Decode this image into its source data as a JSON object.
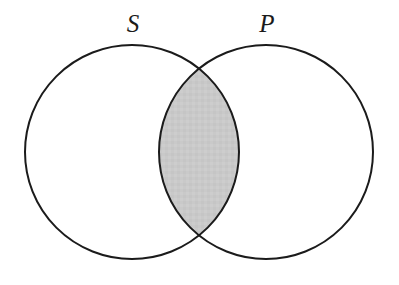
{
  "figure": {
    "name": "venn-diagram",
    "background_color": "#ffffff",
    "width": 399,
    "height": 285
  },
  "diagram": {
    "type": "venn",
    "circle_count": 2,
    "stroke_color": "#1b1b1b",
    "stroke_width": 2,
    "circles": [
      {
        "id": "subject-circle",
        "label": "S",
        "fill_color": "#ffffff",
        "center_x": 132,
        "center_y": 152,
        "radius": 107
      },
      {
        "id": "predicate-circle",
        "label": "P",
        "fill_color": "#ffffff",
        "center_x": 266,
        "center_y": 152,
        "radius": 107
      }
    ],
    "intersection": {
      "id": "intersection-region",
      "label": "",
      "shaded": true,
      "fill_color": "#c9c9c9",
      "left_x": 159,
      "right_x": 239,
      "top_y": 67,
      "bottom_y": 237
    },
    "labels": [
      {
        "id": "label-s",
        "text": "S",
        "x": 133,
        "y": 32,
        "style": "italic"
      },
      {
        "id": "label-p",
        "text": "P",
        "x": 267,
        "y": 32,
        "style": "italic"
      }
    ]
  }
}
